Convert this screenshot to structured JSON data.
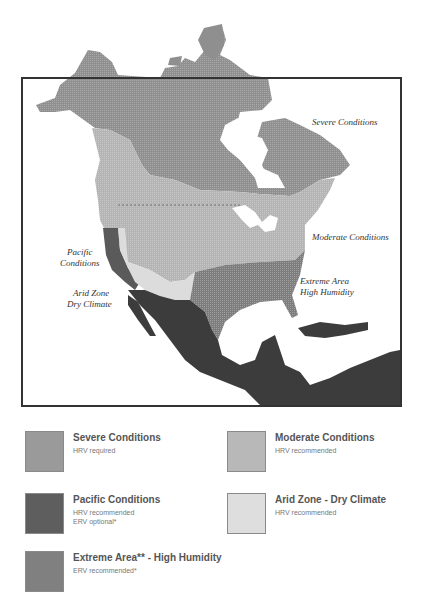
{
  "map": {
    "labels": {
      "severe": "Severe Conditions",
      "moderate": "Moderate Conditions",
      "pacific_line1": "Pacific",
      "pacific_line2": "Conditions",
      "arid_line1": "Arid Zone",
      "arid_line2": "Dry Climate",
      "extreme_line1": "Extreme Area",
      "extreme_line2": "High Humidity"
    },
    "colors": {
      "severe": "#8f8f8f",
      "moderate": "#b4b4b4",
      "pacific": "#5a5a5a",
      "arid": "#dcdcdc",
      "extreme": "#7d7d7d",
      "mexico": "#3c3c3c",
      "frame": "#333333"
    }
  },
  "legend": {
    "items": [
      {
        "title": "Severe Conditions",
        "lines": [
          "HRV required"
        ],
        "color": "#9a9a9a"
      },
      {
        "title": "Moderate Conditions",
        "lines": [
          "HRV recommended"
        ],
        "color": "#b8b8b8"
      },
      {
        "title": "Pacific Conditions",
        "lines": [
          "HRV recommended",
          "ERV optional*"
        ],
        "color": "#5e5e5e"
      },
      {
        "title": "Arid Zone - Dry Climate",
        "lines": [
          "HRV recommended"
        ],
        "color": "#dedede"
      },
      {
        "title": "Extreme Area** - High Humidity",
        "lines": [
          "ERV recommended*"
        ],
        "color": "#808080"
      }
    ]
  }
}
